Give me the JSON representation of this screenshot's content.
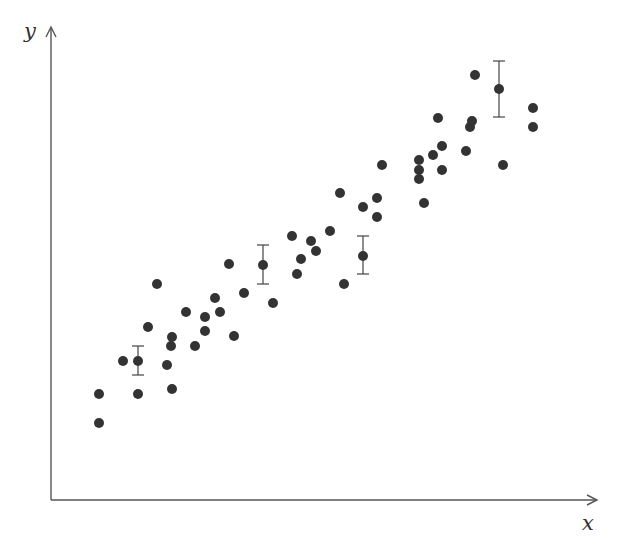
{
  "chart_data": {
    "type": "scatter",
    "title": "",
    "xlabel": "x",
    "ylabel": "y",
    "grid": false,
    "legend": null,
    "axes_style": "arrow-axes, no ticks, no tick labels",
    "coordinate_note": "Values in pixel-derived units relative to the origin (x right, y up); axes have no ticks.",
    "xlim": [
      0,
      546
    ],
    "ylim": [
      0,
      474
    ],
    "point_color": "#333333",
    "series": [
      {
        "name": "data",
        "points": [
          {
            "x": 48,
            "y": 77
          },
          {
            "x": 48,
            "y": 106
          },
          {
            "x": 72,
            "y": 139
          },
          {
            "x": 87,
            "y": 139,
            "err_low": 14,
            "err_high": 15
          },
          {
            "x": 87,
            "y": 106
          },
          {
            "x": 97,
            "y": 173
          },
          {
            "x": 106,
            "y": 216
          },
          {
            "x": 116,
            "y": 135
          },
          {
            "x": 120,
            "y": 154
          },
          {
            "x": 121,
            "y": 163
          },
          {
            "x": 121,
            "y": 111
          },
          {
            "x": 135,
            "y": 188
          },
          {
            "x": 144,
            "y": 154
          },
          {
            "x": 154,
            "y": 183
          },
          {
            "x": 154,
            "y": 169
          },
          {
            "x": 164,
            "y": 202
          },
          {
            "x": 169,
            "y": 188
          },
          {
            "x": 178,
            "y": 236
          },
          {
            "x": 183,
            "y": 164
          },
          {
            "x": 193,
            "y": 207
          },
          {
            "x": 212,
            "y": 235,
            "err_low": 19,
            "err_high": 20
          },
          {
            "x": 222,
            "y": 197
          },
          {
            "x": 241,
            "y": 264
          },
          {
            "x": 246,
            "y": 226
          },
          {
            "x": 250,
            "y": 241
          },
          {
            "x": 260,
            "y": 259
          },
          {
            "x": 265,
            "y": 249
          },
          {
            "x": 279,
            "y": 269
          },
          {
            "x": 289,
            "y": 307
          },
          {
            "x": 293,
            "y": 216
          },
          {
            "x": 312,
            "y": 293
          },
          {
            "x": 312,
            "y": 244,
            "err_low": 18,
            "err_high": 20
          },
          {
            "x": 326,
            "y": 302
          },
          {
            "x": 326,
            "y": 283
          },
          {
            "x": 331,
            "y": 335
          },
          {
            "x": 368,
            "y": 340
          },
          {
            "x": 368,
            "y": 330
          },
          {
            "x": 368,
            "y": 321
          },
          {
            "x": 373,
            "y": 297
          },
          {
            "x": 382,
            "y": 345
          },
          {
            "x": 387,
            "y": 382
          },
          {
            "x": 391,
            "y": 354
          },
          {
            "x": 391,
            "y": 330
          },
          {
            "x": 415,
            "y": 349
          },
          {
            "x": 419,
            "y": 373
          },
          {
            "x": 421,
            "y": 379
          },
          {
            "x": 424,
            "y": 425
          },
          {
            "x": 448,
            "y": 411,
            "err_low": 28,
            "err_high": 28
          },
          {
            "x": 452,
            "y": 335
          },
          {
            "x": 482,
            "y": 392
          },
          {
            "x": 482,
            "y": 373
          }
        ]
      }
    ]
  }
}
